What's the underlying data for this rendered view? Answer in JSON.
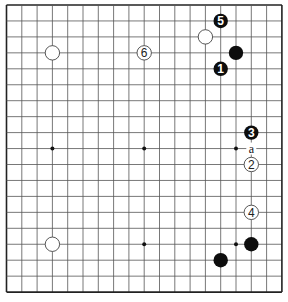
{
  "board": {
    "size": 19,
    "origin_x": 6.5,
    "origin_y": 5,
    "step_x": 15.3,
    "step_y": 15.95,
    "line_color": "#555555",
    "border_color": "#222222",
    "star_points": [
      [
        3,
        9
      ],
      [
        9,
        9
      ],
      [
        15,
        9
      ],
      [
        3,
        15
      ],
      [
        9,
        15
      ],
      [
        15,
        15
      ]
    ]
  },
  "stones": [
    {
      "col": 3,
      "row": 3,
      "color": "white",
      "label": ""
    },
    {
      "col": 9,
      "row": 3,
      "color": "white",
      "label": "6"
    },
    {
      "col": 13,
      "row": 2,
      "color": "white",
      "label": ""
    },
    {
      "col": 14,
      "row": 1,
      "color": "black",
      "label": "5"
    },
    {
      "col": 15,
      "row": 3,
      "color": "black",
      "label": ""
    },
    {
      "col": 14,
      "row": 4,
      "color": "black",
      "label": "1"
    },
    {
      "col": 16,
      "row": 8,
      "color": "black",
      "label": "3"
    },
    {
      "col": 16,
      "row": 10,
      "color": "white",
      "label": "2"
    },
    {
      "col": 16,
      "row": 13,
      "color": "white",
      "label": "4"
    },
    {
      "col": 16,
      "row": 15,
      "color": "black",
      "label": ""
    },
    {
      "col": 14,
      "row": 16,
      "color": "black",
      "label": ""
    },
    {
      "col": 3,
      "row": 15,
      "color": "white",
      "label": ""
    }
  ],
  "markers": [
    {
      "col": 16,
      "row": 9,
      "label": "a"
    }
  ]
}
